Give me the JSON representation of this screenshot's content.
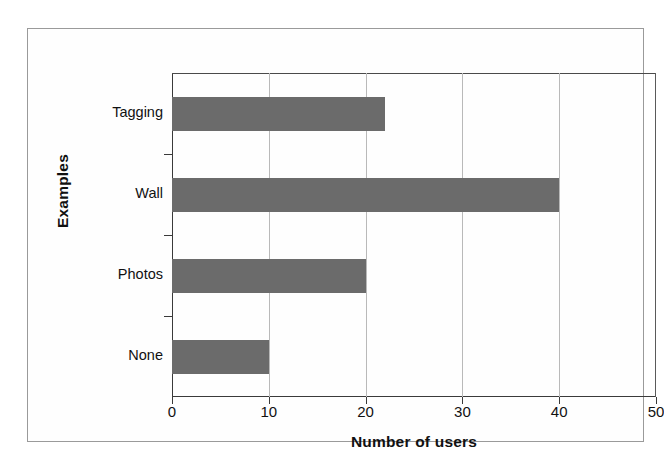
{
  "chart_data": {
    "type": "bar",
    "orientation": "horizontal",
    "title": "",
    "xlabel": "Number of users",
    "ylabel": "Examples",
    "categories": [
      "Tagging",
      "Wall",
      "Photos",
      "None"
    ],
    "values": [
      22,
      40,
      20,
      10
    ],
    "series": [
      {
        "name": "Number of users",
        "values": [
          22,
          40,
          20,
          10
        ]
      }
    ],
    "xlim": [
      0,
      50
    ],
    "xticks": [
      0,
      10,
      20,
      30,
      40,
      50
    ],
    "xtick_labels": [
      "0",
      "10",
      "20",
      "30",
      "40",
      "50"
    ],
    "grid": "vertical",
    "legend": "none",
    "bar_color": "#6b6b6b",
    "axis_color": "#3a3a3a",
    "gridline_color": "#b9b9b9",
    "frame_color": "#9a9a9a",
    "background_color": "#ffffff"
  }
}
